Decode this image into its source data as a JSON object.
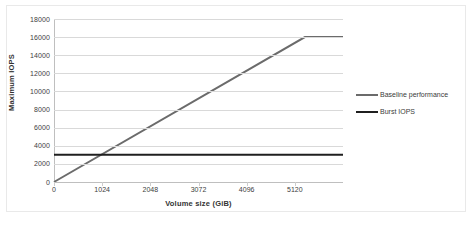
{
  "chart_data": {
    "type": "line",
    "title": "",
    "xlabel": "Volume size (GiB)",
    "ylabel": "Maximum IOPS",
    "xlim": [
      0,
      6144
    ],
    "ylim": [
      0,
      18000
    ],
    "grid": true,
    "legend_position": "right",
    "x_ticks": [
      0,
      1024,
      2048,
      3072,
      4096,
      5120
    ],
    "x_tick_labels": [
      "0",
      "1024",
      "2048",
      "3072",
      "4096",
      "5120"
    ],
    "y_ticks": [
      0,
      2000,
      4000,
      6000,
      8000,
      10000,
      12000,
      14000,
      16000,
      18000
    ],
    "y_tick_labels": [
      "0",
      "2000",
      "4000",
      "6000",
      "8000",
      "10000",
      "12000",
      "14000",
      "16000",
      "18000"
    ],
    "series": [
      {
        "name": "Baseline performance",
        "color": "#6b6b6b",
        "x": [
          0,
          5334,
          6144
        ],
        "values": [
          0,
          16000,
          16000
        ]
      },
      {
        "name": "Burst IOPS",
        "color": "#1f1f1f",
        "x": [
          0,
          6144
        ],
        "values": [
          3000,
          3000
        ]
      }
    ],
    "annotations": []
  },
  "legend": {
    "entries": [
      {
        "label": "Baseline performance",
        "color": "#6b6b6b"
      },
      {
        "label": "Burst IOPS",
        "color": "#1f1f1f"
      }
    ]
  },
  "colors": {
    "baseline": "#6b6b6b",
    "burst": "#1f1f1f",
    "gridline": "#d9d9d9",
    "axis": "#bfbfbf",
    "text": "#404040",
    "background": "#ffffff",
    "frame": "#e9e9e9"
  }
}
